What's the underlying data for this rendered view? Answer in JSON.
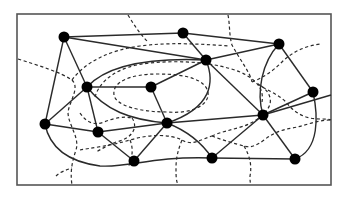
{
  "diagram": {
    "type": "planar-graph-with-dual",
    "frame": {
      "x": 17,
      "y": 14,
      "width": 314,
      "height": 171,
      "stroke": "#555555"
    },
    "colors": {
      "node": "#000000",
      "edge": "#2a2a2a",
      "dual": "#2a2a2a",
      "background": "#ffffff"
    },
    "nodes": [
      {
        "id": "n1",
        "x": 64,
        "y": 37
      },
      {
        "id": "n2",
        "x": 183,
        "y": 33
      },
      {
        "id": "n3",
        "x": 279,
        "y": 44
      },
      {
        "id": "n4",
        "x": 206,
        "y": 60
      },
      {
        "id": "n5",
        "x": 87,
        "y": 87
      },
      {
        "id": "n6",
        "x": 151,
        "y": 87
      },
      {
        "id": "n7",
        "x": 313,
        "y": 92
      },
      {
        "id": "n8",
        "x": 45,
        "y": 124
      },
      {
        "id": "n9",
        "x": 98,
        "y": 132
      },
      {
        "id": "n10",
        "x": 167,
        "y": 123
      },
      {
        "id": "n11",
        "x": 263,
        "y": 115
      },
      {
        "id": "n12",
        "x": 134,
        "y": 161
      },
      {
        "id": "n13",
        "x": 212,
        "y": 158
      },
      {
        "id": "n14",
        "x": 295,
        "y": 159
      }
    ],
    "edges": [
      {
        "from": "n1",
        "to": "n2"
      },
      {
        "from": "n1",
        "to": "n4"
      },
      {
        "from": "n1",
        "to": "n5"
      },
      {
        "from": "n1",
        "to": "n8"
      },
      {
        "from": "n2",
        "to": "n3"
      },
      {
        "from": "n2",
        "to": "n4"
      },
      {
        "from": "n3",
        "to": "n4"
      },
      {
        "from": "n3",
        "to": "n7"
      },
      {
        "from": "n3",
        "to": "n11",
        "curved": true
      },
      {
        "from": "n4",
        "to": "n5",
        "curved": true
      },
      {
        "from": "n4",
        "to": "n6"
      },
      {
        "from": "n4",
        "to": "n10",
        "curved": true
      },
      {
        "from": "n4",
        "to": "n11"
      },
      {
        "from": "n5",
        "to": "n6"
      },
      {
        "from": "n5",
        "to": "n8"
      },
      {
        "from": "n5",
        "to": "n9"
      },
      {
        "from": "n5",
        "to": "n10",
        "curved": true
      },
      {
        "from": "n6",
        "to": "n10"
      },
      {
        "from": "n7",
        "to": "n11"
      },
      {
        "from": "n7",
        "to": "n14",
        "curved": true
      },
      {
        "from": "n8",
        "to": "n9"
      },
      {
        "from": "n8",
        "to": "n13",
        "curved": true
      },
      {
        "from": "n9",
        "to": "n10"
      },
      {
        "from": "n9",
        "to": "n12"
      },
      {
        "from": "n10",
        "to": "n11"
      },
      {
        "from": "n10",
        "to": "n12"
      },
      {
        "from": "n11",
        "to": "n13"
      },
      {
        "from": "n11",
        "to": "n14"
      },
      {
        "from": "n12",
        "to": "n13"
      },
      {
        "from": "n13",
        "to": "n14"
      }
    ],
    "dual_edges_style": "dashed"
  }
}
